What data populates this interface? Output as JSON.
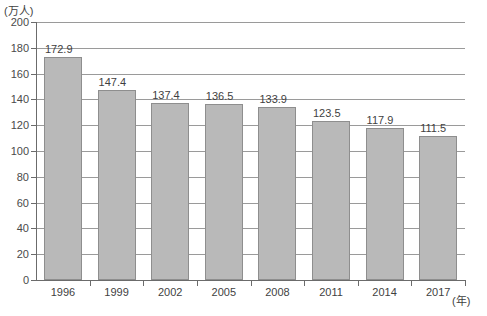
{
  "chart_data": {
    "type": "bar",
    "title": "",
    "subtitle": "",
    "xlabel": "(年)",
    "ylabel": "(万人)",
    "categories": [
      "1996",
      "1999",
      "2002",
      "2005",
      "2008",
      "2011",
      "2014",
      "2017"
    ],
    "values": [
      172.9,
      147.4,
      137.4,
      136.5,
      133.9,
      123.5,
      117.9,
      111.5
    ],
    "value_labels": [
      "172.9",
      "147.4",
      "137.4",
      "136.5",
      "133.9",
      "123.5",
      "117.9",
      "111.5"
    ],
    "ylim": [
      0,
      200
    ],
    "ytick_values": [
      0,
      20,
      40,
      60,
      80,
      100,
      120,
      140,
      160,
      180,
      200
    ],
    "ytick_labels": [
      "0",
      "20",
      "40",
      "60",
      "80",
      "100",
      "120",
      "140",
      "160",
      "180",
      "200"
    ],
    "grid": "horizontal",
    "legend": "none",
    "bar_color": "#b9b9b9",
    "bar_border_color": "#8e8e8e",
    "gridline_color": "#9a9a9a",
    "axis_color": "#6b6b6b",
    "background_color": "#ffffff"
  }
}
